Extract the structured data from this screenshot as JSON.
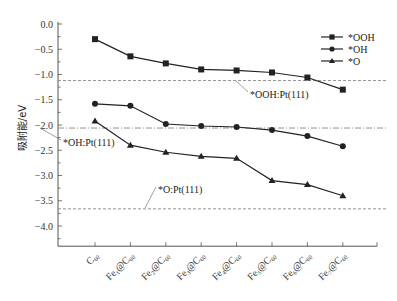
{
  "chart_data": {
    "type": "line",
    "title": "",
    "xlabel": "",
    "ylabel": "吸附能/eV",
    "ylim": [
      -4.4,
      0.0
    ],
    "yticks": [
      0.0,
      -0.5,
      -1.0,
      -1.5,
      -2.0,
      -2.5,
      -3.0,
      -3.5,
      -4.0
    ],
    "ytick_labels": [
      "0.0",
      "-0.5",
      "-1.0",
      "-1.5",
      "-2.0",
      "-2.5",
      "-3.0",
      "-3.5",
      "-4.0"
    ],
    "grid": false,
    "legend_position": "upper right",
    "categories": [
      {
        "base": "C",
        "sub1": "",
        "mid": "",
        "sub2": "60",
        "full": "C60"
      },
      {
        "base": "Fe",
        "sub1": "1",
        "mid": "@C",
        "sub2": "60",
        "full": "Fe1@C60"
      },
      {
        "base": "Fe",
        "sub1": "2",
        "mid": "@C",
        "sub2": "60",
        "full": "Fe2@C60"
      },
      {
        "base": "Fe",
        "sub1": "3",
        "mid": "@C",
        "sub2": "60",
        "full": "Fe3@C60"
      },
      {
        "base": "Fe",
        "sub1": "4",
        "mid": "@C",
        "sub2": "60",
        "full": "Fe4@C60"
      },
      {
        "base": "Fe",
        "sub1": "5",
        "mid": "@C",
        "sub2": "60",
        "full": "Fe5@C60"
      },
      {
        "base": "Fe",
        "sub1": "6",
        "mid": "@C",
        "sub2": "60",
        "full": "Fe6@C60"
      },
      {
        "base": "Fe",
        "sub1": "7",
        "mid": "@C",
        "sub2": "60",
        "full": "Fe7@C60"
      }
    ],
    "series": [
      {
        "name": "*OOH",
        "marker": "square",
        "values": [
          -0.3,
          -0.64,
          -0.78,
          -0.9,
          -0.92,
          -0.96,
          -1.06,
          -1.3
        ]
      },
      {
        "name": "*OH",
        "marker": "circle",
        "values": [
          -1.58,
          -1.62,
          -1.98,
          -2.02,
          -2.04,
          -2.1,
          -2.22,
          -2.42
        ]
      },
      {
        "name": "*O",
        "marker": "triangle",
        "values": [
          -1.92,
          -2.4,
          -2.54,
          -2.62,
          -2.66,
          -3.1,
          -3.18,
          -3.4
        ]
      }
    ],
    "reference_lines": [
      {
        "label": "*OOH:Pt(111)",
        "value": -1.12
      },
      {
        "label": "*OH:Pt(111)",
        "value": -2.06
      },
      {
        "label": "*O:Pt(111)",
        "value": -3.66
      }
    ],
    "colors": {
      "line": "#222222",
      "axis": "#555555",
      "reference": "#777777"
    }
  }
}
